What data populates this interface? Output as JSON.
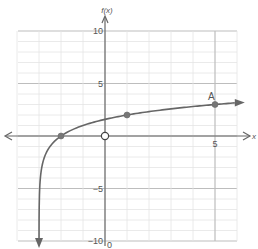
{
  "chart_data": {
    "type": "line",
    "title": "",
    "function_label": "f(x)",
    "xlabel": "x",
    "ylabel": "f(x)",
    "xlim": [
      -4,
      6
    ],
    "ylim": [
      -10,
      10
    ],
    "grid": true,
    "x_ticks": [
      {
        "value": 5,
        "label": "5"
      }
    ],
    "y_ticks": [
      {
        "value": 10,
        "label": "10"
      },
      {
        "value": 5,
        "label": "5"
      },
      {
        "value": -5,
        "label": "-5"
      },
      {
        "value": -10,
        "label": "-10"
      }
    ],
    "series": [
      {
        "name": "f(x) = log2(x + 3)",
        "color": "#666666",
        "vertical_asymptote": -3,
        "x": [
          -2.999,
          -2.99,
          -2.95,
          -2.9,
          -2.8,
          -2.6,
          -2.4,
          -2.2,
          -2,
          -1.5,
          -1,
          -0.5,
          0,
          0.5,
          1,
          2,
          3,
          4,
          5,
          6
        ],
        "values": [
          -9.97,
          -6.64,
          -4.32,
          -3.32,
          -2.32,
          -1.32,
          -0.74,
          -0.32,
          0,
          0.58,
          1,
          1.32,
          1.58,
          1.81,
          2,
          2.32,
          2.58,
          2.81,
          3,
          3.17
        ]
      }
    ],
    "points": [
      {
        "x": -2,
        "y": 0,
        "label": "",
        "style": "filled"
      },
      {
        "x": 1,
        "y": 2,
        "label": "",
        "style": "filled"
      },
      {
        "x": 5,
        "y": 3,
        "label": "A",
        "style": "filled"
      },
      {
        "x": 0,
        "y": 0,
        "label": "",
        "style": "open"
      }
    ],
    "origin_label": "0"
  }
}
